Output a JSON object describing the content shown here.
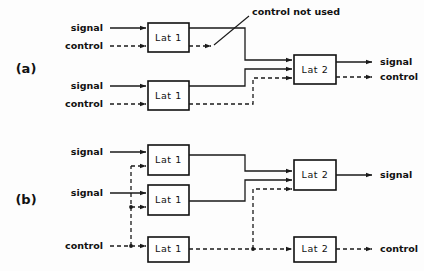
{
  "figure": {
    "background_color": "#fdfdfd",
    "line_color": "#1a1a1a",
    "box_fill": "#ffffff",
    "box_stroke": "#111111"
  },
  "panels": [
    {
      "id": "a",
      "label": "(a)",
      "inputs": [
        {
          "label": "signal",
          "type": "signal"
        },
        {
          "label": "control",
          "type": "control"
        },
        {
          "label": "signal",
          "type": "signal"
        },
        {
          "label": "control",
          "type": "control"
        }
      ],
      "boxes": [
        {
          "label": "Lat 1"
        },
        {
          "label": "Lat 1"
        },
        {
          "label": "Lat 2"
        }
      ],
      "outputs": [
        {
          "label": "signal",
          "type": "signal"
        },
        {
          "label": "control",
          "type": "control"
        }
      ],
      "annotation": {
        "text": "control not used"
      }
    },
    {
      "id": "b",
      "label": "(b)",
      "inputs": [
        {
          "label": "signal",
          "type": "signal"
        },
        {
          "label": "signal",
          "type": "signal"
        },
        {
          "label": "control",
          "type": "control"
        }
      ],
      "boxes": [
        {
          "label": "Lat 1"
        },
        {
          "label": "Lat 1"
        },
        {
          "label": "Lat 1"
        },
        {
          "label": "Lat 2"
        },
        {
          "label": "Lat 2"
        }
      ],
      "outputs": [
        {
          "label": "signal",
          "type": "signal"
        },
        {
          "label": "control",
          "type": "control"
        }
      ]
    }
  ]
}
